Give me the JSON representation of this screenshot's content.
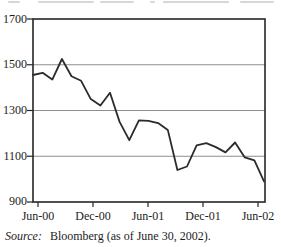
{
  "figure": {
    "source": {
      "label": "Source:",
      "text": "Bloomberg (as of June 30, 2002)."
    }
  },
  "chart_data": {
    "type": "line",
    "title": "",
    "categories": [
      "Jun-00",
      "Jul-00",
      "Aug-00",
      "Sep-00",
      "Oct-00",
      "Nov-00",
      "Dec-00",
      "Jan-01",
      "Feb-01",
      "Mar-01",
      "Apr-01",
      "May-01",
      "Jun-01",
      "Jul-01",
      "Aug-01",
      "Sep-01",
      "Oct-01",
      "Nov-01",
      "Dec-01",
      "Jan-02",
      "Feb-02",
      "Mar-02",
      "Apr-02",
      "May-02",
      "Jun-02"
    ],
    "values": [
      1455,
      1465,
      1435,
      1525,
      1450,
      1430,
      1350,
      1322,
      1378,
      1250,
      1170,
      1257,
      1255,
      1245,
      1215,
      1040,
      1055,
      1148,
      1157,
      1140,
      1117,
      1160,
      1095,
      1082,
      990
    ],
    "xlabel": "",
    "ylabel": "",
    "ylim": [
      900,
      1700
    ],
    "yticks": [
      1700,
      1500,
      1300,
      1100,
      900
    ],
    "ytick_labels": [
      "1700",
      "1500",
      "1300",
      "1100",
      "900"
    ],
    "xtick_labels": [
      "Jun-00",
      "Dec-00",
      "Jun-01",
      "Dec-01",
      "Jun-02"
    ],
    "gridlines_at": [
      1500,
      1300,
      1100
    ],
    "grid_on": true,
    "legend": "none",
    "line_color": "#2b2b2b",
    "grid_color": "#8e8e8e",
    "frame_color": "#262626"
  }
}
